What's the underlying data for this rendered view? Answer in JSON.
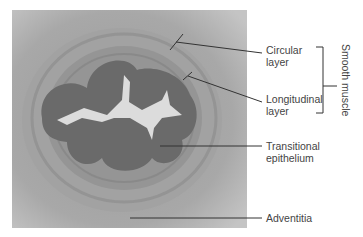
{
  "figure": {
    "labels": {
      "circular": [
        "Circular",
        "layer"
      ],
      "longitudinal": [
        "Longitudinal",
        "layer"
      ],
      "transitional": [
        "Transitional",
        "epithelium"
      ],
      "adventitia": "Adventitia",
      "group": "Smooth muscle"
    },
    "colors": {
      "background_tissue": "#b4b4b4",
      "muscle_ring": "#8e8e8e",
      "epithelium": "#6a6a6a",
      "lumen": "#dcdcdc",
      "leader_lines": "#333333"
    }
  }
}
